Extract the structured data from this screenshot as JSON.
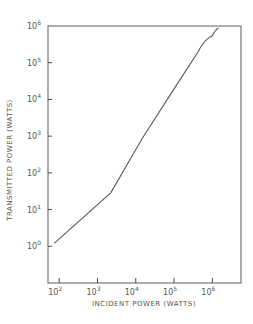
{
  "chart_data": {
    "type": "line",
    "title": "",
    "xlabel": "INCIDENT POWER (WATTS)",
    "ylabel": "TRANSMITTED POWER (WATTS)",
    "xscale": "log",
    "yscale": "log",
    "xlim": [
      51,
      5600000
    ],
    "ylim": [
      0.1,
      1000000
    ],
    "grid": false,
    "legend": null,
    "x_ticks": [
      {
        "base": "10",
        "exp": "2",
        "value": 100
      },
      {
        "base": "10",
        "exp": "3",
        "value": 1000
      },
      {
        "base": "10",
        "exp": "4",
        "value": 10000
      },
      {
        "base": "10",
        "exp": "5",
        "value": 100000
      },
      {
        "base": "10",
        "exp": "6",
        "value": 1000000
      }
    ],
    "y_ticks": [
      {
        "base": "10",
        "exp": "0",
        "value": 1
      },
      {
        "base": "10",
        "exp": "1",
        "value": 10
      },
      {
        "base": "10",
        "exp": "2",
        "value": 100
      },
      {
        "base": "10",
        "exp": "3",
        "value": 1000
      },
      {
        "base": "10",
        "exp": "4",
        "value": 10000
      },
      {
        "base": "10",
        "exp": "5",
        "value": 100000
      },
      {
        "base": "10",
        "exp": "6",
        "value": 1000000
      }
    ],
    "series": [
      {
        "name": "Transmitted vs incident power",
        "x": [
          74,
          2240,
          15000,
          102000,
          410000,
          1000000,
          1450000
        ],
        "y": [
          1.2,
          29,
          890,
          20000,
          186000,
          540000,
          890000
        ]
      }
    ]
  },
  "labels": {
    "xlabel": "INCIDENT POWER (WATTS)",
    "ylabel": "TRANSMITTED POWER (WATTS)"
  },
  "colors": {
    "axis": "#6a6a6a",
    "curve": "#5a5a5a",
    "text": "#555555",
    "background": "#ffffff"
  }
}
